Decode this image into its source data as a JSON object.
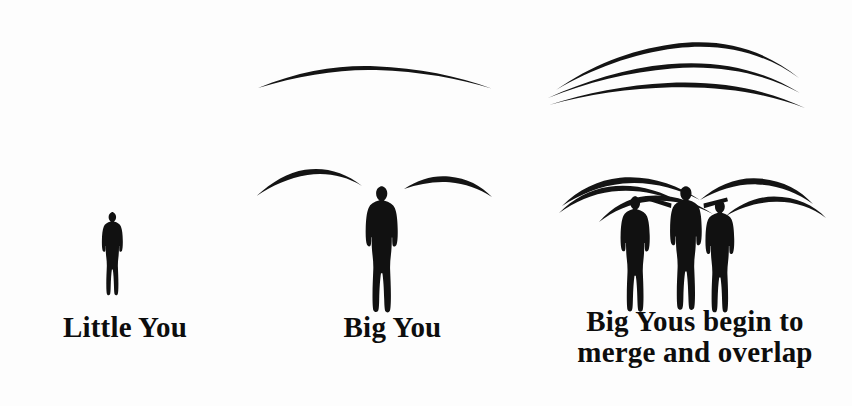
{
  "canvas": {
    "width": 852,
    "height": 406,
    "background_color": "#fdfdfd",
    "ink_color": "#111111"
  },
  "diagram": {
    "type": "conceptual-illustration",
    "panel_count": 3
  },
  "panels": [
    {
      "id": "panel-little-you",
      "caption": "Little You",
      "figure_count": 1,
      "arc_count": 0,
      "figure_scale": "small",
      "figures": [
        {
          "name": "little-you-figure",
          "x": 103,
          "y": 212,
          "width": 23,
          "height": 84
        }
      ],
      "arcs": []
    },
    {
      "id": "panel-big-you",
      "caption": "Big You",
      "figure_count": 1,
      "arc_count": 3,
      "figure_scale": "large",
      "figures": [
        {
          "name": "big-you-figure",
          "x": 366,
          "y": 186,
          "width": 35,
          "height": 107
        }
      ],
      "arcs": [
        {
          "name": "big-you-upper-arc",
          "span_x": [
            258,
            492
          ],
          "apex_y": 66
        },
        {
          "name": "big-you-left-wing-arc",
          "span_x": [
            257,
            362
          ],
          "apex_y": 170
        },
        {
          "name": "big-you-right-wing-arc",
          "span_x": [
            404,
            492
          ],
          "apex_y": 176
        }
      ]
    },
    {
      "id": "panel-big-yous-merge",
      "caption_line_1": "Big Yous begin to",
      "caption_line_2": "merge and overlap",
      "caption": "Big Yous begin to merge and overlap",
      "figure_count": 3,
      "arc_count": 8,
      "figure_scale": "large",
      "figures": [
        {
          "name": "merge-figure-left",
          "x": 621,
          "y": 196,
          "width": 32,
          "height": 98
        },
        {
          "name": "merge-figure-center",
          "x": 671,
          "y": 186,
          "width": 33,
          "height": 107
        },
        {
          "name": "merge-figure-right",
          "x": 706,
          "y": 200,
          "width": 31,
          "height": 97
        }
      ],
      "arcs": [
        {
          "name": "merge-upper-arc-1",
          "span_x": [
            556,
            800
          ],
          "apex_y": 43
        },
        {
          "name": "merge-upper-arc-2",
          "span_x": [
            548,
            800
          ],
          "apex_y": 63
        },
        {
          "name": "merge-upper-arc-3",
          "span_x": [
            549,
            805
          ],
          "apex_y": 82
        },
        {
          "name": "merge-wing-arc-a",
          "span_x": [
            563,
            700
          ],
          "apex_y": 178
        },
        {
          "name": "merge-wing-arc-b",
          "span_x": [
            560,
            680
          ],
          "apex_y": 186
        },
        {
          "name": "merge-wing-arc-c",
          "span_x": [
            600,
            712
          ],
          "apex_y": 196
        },
        {
          "name": "merge-wing-arc-d",
          "span_x": [
            700,
            812
          ],
          "apex_y": 178
        },
        {
          "name": "merge-wing-arc-e",
          "span_x": [
            726,
            824
          ],
          "apex_y": 196
        }
      ]
    }
  ],
  "labels": {
    "little_you": "Little You",
    "big_you": "Big You",
    "big_yous_line1": "Big Yous begin to",
    "big_yous_line2": "merge and overlap"
  }
}
